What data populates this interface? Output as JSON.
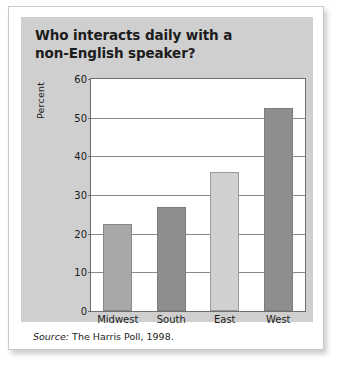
{
  "figure": {
    "source_word": "Source:",
    "source_text": "The Harris Poll, 1998."
  },
  "colors": {
    "card_background": "#ffffff",
    "panel_background": "#cfcfcf",
    "plot_background": "#ffffff",
    "gridline": "#8a8a8a",
    "axis": "#6e6e6e",
    "text": "#1c1c1c",
    "bar_medium_gray": "#a8a8a8",
    "bar_dark_gray": "#8e8e8e",
    "bar_light_gray": "#d0d0d0"
  },
  "chart_data": {
    "type": "bar",
    "xlabel": "",
    "ylabel": "Percent",
    "categories": [
      "Midwest",
      "South",
      "East",
      "West"
    ],
    "values": [
      22.5,
      27,
      36,
      52.5
    ],
    "bar_colors": [
      "#a8a8a8",
      "#8e8e8e",
      "#d0d0d0",
      "#8e8e8e"
    ],
    "ylim": [
      0,
      60
    ],
    "yticks": [
      0,
      10,
      20,
      30,
      40,
      50,
      60
    ],
    "ytick_labels": [
      "0",
      "10",
      "20",
      "30",
      "40",
      "50",
      "60"
    ],
    "grid": true,
    "legend": null,
    "source": "Source: The Harris Poll, 1998."
  }
}
